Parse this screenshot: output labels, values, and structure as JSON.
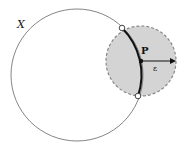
{
  "diagram": {
    "labels": {
      "set": "X",
      "point": "P",
      "radius": "ε"
    },
    "colors": {
      "stroke": "#777777",
      "arc": "#111111",
      "neighborhood_fill": "#d4d4d4",
      "neighborhood_stroke": "#888888"
    },
    "large_circle": {
      "cx": 77,
      "cy": 75,
      "r": 66
    },
    "neighborhood": {
      "cx": 141,
      "cy": 61,
      "r": 35
    },
    "open_points": [
      {
        "x": 122,
        "y": 28
      },
      {
        "x": 138,
        "y": 96
      }
    ]
  }
}
